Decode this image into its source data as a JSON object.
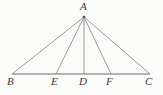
{
  "figure": {
    "kind": "geometry-diagram",
    "background_color": "#fbfbfa",
    "line_color": "#8d8d8d",
    "baseline_color": "#9a9a9a",
    "label_color": "#3a3a3a",
    "width": 163,
    "height": 95,
    "points": [
      {
        "id": "A",
        "label": "A",
        "x": 84,
        "y": 17,
        "label_x": 80,
        "label_y": 1
      },
      {
        "id": "B",
        "label": "B",
        "x": 12,
        "y": 74,
        "label_x": 7,
        "label_y": 76
      },
      {
        "id": "E",
        "label": "E",
        "x": 56,
        "y": 74,
        "label_x": 51,
        "label_y": 76
      },
      {
        "id": "D",
        "label": "D",
        "x": 84,
        "y": 74,
        "label_x": 79,
        "label_y": 76
      },
      {
        "id": "F",
        "label": "F",
        "x": 111,
        "y": 74,
        "label_x": 106,
        "label_y": 76
      },
      {
        "id": "C",
        "label": "C",
        "x": 150,
        "y": 74,
        "label_x": 145,
        "label_y": 76
      }
    ],
    "segments": [
      {
        "id": "AB",
        "from": "A",
        "to": "B",
        "x1": 84,
        "y1": 17,
        "x2": 12,
        "y2": 74
      },
      {
        "id": "AC",
        "from": "A",
        "to": "C",
        "x1": 84,
        "y1": 17,
        "x2": 150,
        "y2": 74
      },
      {
        "id": "AE",
        "from": "A",
        "to": "E",
        "x1": 84,
        "y1": 17,
        "x2": 56,
        "y2": 74
      },
      {
        "id": "AD",
        "from": "A",
        "to": "D",
        "x1": 84,
        "y1": 17,
        "x2": 84,
        "y2": 74
      },
      {
        "id": "AF",
        "from": "A",
        "to": "F",
        "x1": 84,
        "y1": 17,
        "x2": 111,
        "y2": 74
      },
      {
        "id": "BC",
        "from": "B",
        "to": "C",
        "x1": 12,
        "y1": 74,
        "x2": 150,
        "y2": 74
      }
    ]
  }
}
